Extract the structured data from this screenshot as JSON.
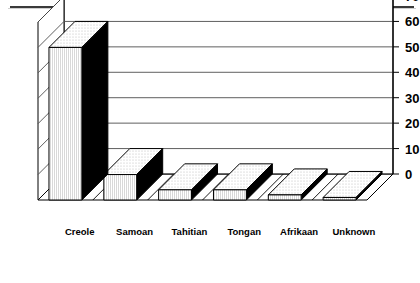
{
  "chart_data": {
    "type": "bar",
    "title": "",
    "subtitle": "",
    "xlabel": "",
    "ylabel": "",
    "categories": [
      "Creole",
      "Samoan",
      "Tahitian",
      "Tongan",
      "Afrikaan",
      "Unknown"
    ],
    "values": [
      60,
      10,
      4,
      4,
      2,
      1
    ],
    "series": [
      {
        "name": "",
        "values": [
          60,
          10,
          4,
          4,
          2,
          1
        ]
      }
    ],
    "ylim": [
      0,
      70
    ],
    "yticks": [
      0,
      10,
      20,
      30,
      40,
      50,
      60,
      70
    ],
    "ytick_labels": [
      "0",
      "10",
      "20",
      "30",
      "40",
      "50",
      "60",
      "70"
    ],
    "axis_position": "right",
    "grid": true,
    "grid_axis": "y",
    "legend": false,
    "legend_position": "none",
    "projection": "3d-oblique",
    "annotations": [],
    "style": {
      "bar_front_color": "#f2f2f2",
      "bar_side_color": "#000000",
      "bar_top_color": "#ebebeb",
      "outline_color": "#000000",
      "background_color": "#ffffff",
      "grid_color": "#4d4d4d"
    }
  },
  "artifacts": {
    "top_rule_color": "#3a3a3a"
  }
}
